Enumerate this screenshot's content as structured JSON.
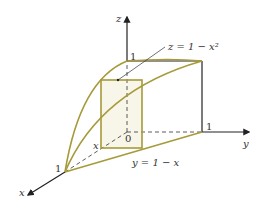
{
  "diagram": {
    "type": "3d-region-sketch",
    "axes": {
      "x_label": "x",
      "y_label": "y",
      "z_label": "z",
      "origin_label": "0"
    },
    "ticks": {
      "x_one": "1",
      "y_one": "1",
      "z_one": "1"
    },
    "annotations": {
      "surface": "z = 1 − x²",
      "plane": "y = 1 − x",
      "slice_position": "x"
    },
    "colors": {
      "curve": "#a69a3a",
      "axis": "#222222",
      "slice_fill": "#f7f6e8"
    }
  }
}
